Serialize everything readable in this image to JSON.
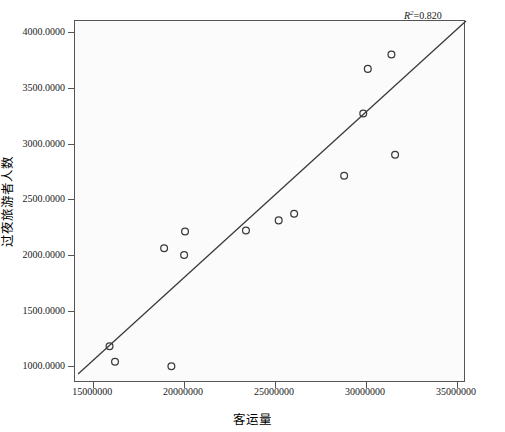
{
  "chart_data": {
    "type": "scatter",
    "title": "",
    "xlabel": "客运量",
    "ylabel": "过夜旅游者人数",
    "xlim": [
      14000000,
      35500000
    ],
    "ylim": [
      850,
      4100
    ],
    "xticks": [
      15000000,
      20000000,
      25000000,
      30000000,
      35000000
    ],
    "xticklabels": [
      "15000000",
      "20000000",
      "25000000",
      "30000000",
      "35000000"
    ],
    "yticks": [
      1000,
      1500,
      2000,
      2500,
      3000,
      3500,
      4000
    ],
    "yticklabels": [
      "1000.0000",
      "1500.0000",
      "2000.0000",
      "2500.0000",
      "3000.0000",
      "3500.0000",
      "4000.0000"
    ],
    "grid": false,
    "legend": null,
    "marker": "open-circle",
    "marker_color": "#3a3a3a",
    "plot_background": "#fbfbfb",
    "frame_color": "#555555",
    "points": [
      {
        "x": 15900000,
        "y": 1180
      },
      {
        "x": 16200000,
        "y": 1040
      },
      {
        "x": 18900000,
        "y": 2060
      },
      {
        "x": 19300000,
        "y": 1000
      },
      {
        "x": 20050000,
        "y": 2210
      },
      {
        "x": 20000000,
        "y": 2000
      },
      {
        "x": 23400000,
        "y": 2220
      },
      {
        "x": 25200000,
        "y": 2310
      },
      {
        "x": 26050000,
        "y": 2370
      },
      {
        "x": 28800000,
        "y": 2710
      },
      {
        "x": 29850000,
        "y": 3270
      },
      {
        "x": 30100000,
        "y": 3670
      },
      {
        "x": 31400000,
        "y": 3800
      },
      {
        "x": 31600000,
        "y": 2900
      }
    ],
    "fit_line": {
      "type": "linear",
      "x_start": 14170000,
      "y_start": 930,
      "x_end": 35500000,
      "y_end": 4100
    },
    "annotations": [
      {
        "name": "r-squared",
        "text_prefix": "R",
        "text_sup": "2",
        "text_value": "=0.820",
        "position": "top-right-outside"
      }
    ]
  }
}
